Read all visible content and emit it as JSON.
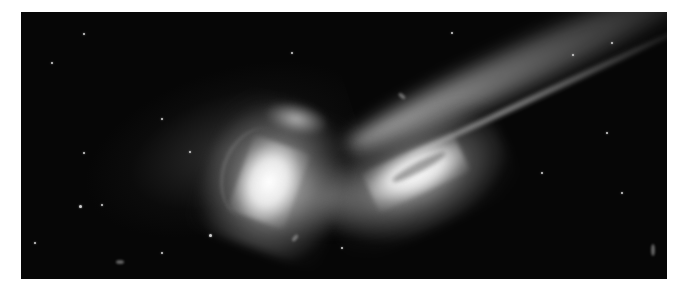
{
  "image": {
    "subject": "interacting galaxy pair with long tidal tail",
    "description": "Two colliding spiral galaxies on a black star field; left galaxy with curved spiral arms, right galaxy elongated with a bright tail extending to the upper right",
    "colors": {
      "background": "#060606",
      "border": "#ffffff",
      "galaxy_core": "#ffffff",
      "glow": "#b4b4b4"
    }
  }
}
